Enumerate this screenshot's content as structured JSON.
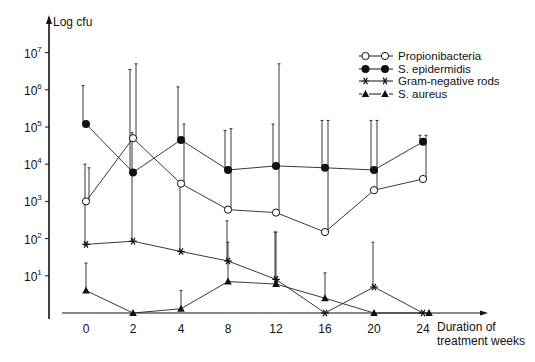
{
  "chart_data": {
    "type": "line",
    "title": "",
    "ylabel": "Log cfu",
    "xlabel": "Duration of treatment weeks",
    "yscale": "log",
    "ylim": [
      1,
      10000000
    ],
    "yticks": [
      "10^1",
      "10^2",
      "10^3",
      "10^4",
      "10^5",
      "10^6",
      "10^7"
    ],
    "x": [
      0,
      2,
      4,
      8,
      12,
      16,
      20,
      24
    ],
    "xtick_labels": [
      "0",
      "2",
      "4",
      "8",
      "12",
      "16",
      "20",
      "24"
    ],
    "grid": false,
    "legend_position": "top-right",
    "series": [
      {
        "name": "Propionibacteria",
        "marker": "open-circle",
        "values": [
          1000,
          50000,
          3000,
          600,
          500,
          150,
          2000,
          4000
        ],
        "error_upper": [
          8000,
          5000000,
          120000,
          90000,
          5000000,
          150000,
          150000,
          60000
        ]
      },
      {
        "name": "S. epidermidis",
        "marker": "filled-circle",
        "values": [
          120000,
          6000,
          45000,
          7000,
          9000,
          8000,
          7000,
          40000
        ],
        "error_upper": [
          1300000,
          3500000,
          1200000,
          80000,
          120000,
          150000,
          150000,
          60000
        ]
      },
      {
        "name": "Gram-negative rods",
        "marker": "asterisk",
        "values": [
          70,
          85,
          45,
          25,
          8,
          1,
          5,
          1
        ],
        "error_upper": [
          10000,
          70000,
          3000,
          300,
          150,
          1,
          80,
          1
        ]
      },
      {
        "name": "S. aureus",
        "marker": "filled-triangle",
        "values": [
          4,
          1,
          1.3,
          7,
          6,
          2.5,
          1,
          1
        ],
        "error_upper": [
          22,
          1,
          4,
          80,
          150,
          12,
          1,
          1
        ]
      }
    ]
  },
  "labels": {
    "ylabel": "Log cfu",
    "xlabel_line1": "Duration of",
    "xlabel_line2": "treatment weeks"
  },
  "legend": [
    {
      "label": "Propionibacteria",
      "marker": "open-circle"
    },
    {
      "label": "S. epidermidis",
      "marker": "filled-circle"
    },
    {
      "label": "Gram-negative rods",
      "marker": "asterisk"
    },
    {
      "label": "S. aureus",
      "marker": "filled-triangle"
    }
  ]
}
